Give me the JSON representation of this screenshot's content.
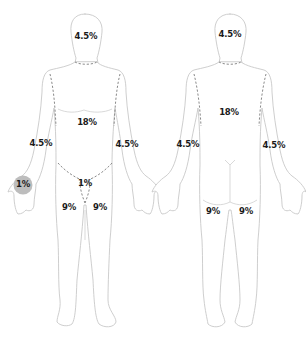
{
  "views": [
    {
      "name": "front",
      "labels": {
        "head": "4.5%",
        "trunk": "18%",
        "left_arm": "4.5%",
        "right_arm": "4.5%",
        "palm": "1%",
        "genitals": "1%",
        "left_leg": "9%",
        "right_leg": "9%"
      }
    },
    {
      "name": "back",
      "labels": {
        "head": "4.5%",
        "trunk": "18%",
        "left_arm": "4.5%",
        "right_arm": "4.5%",
        "left_leg": "9%",
        "right_leg": "9%"
      }
    }
  ],
  "colors": {
    "outline": "#c8c8c8",
    "dashed_boundary": "#8a8a8a",
    "palm_highlight": "#bdbdbd",
    "label_text": "#1a1a1a"
  }
}
